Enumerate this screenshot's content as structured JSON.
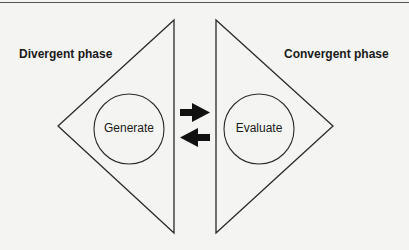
{
  "diagram": {
    "phases": [
      {
        "label": "Divergent phase",
        "node": "Generate"
      },
      {
        "label": "Convergent phase",
        "node": "Evaluate"
      }
    ],
    "arrows": [
      {
        "direction": "right",
        "meaning": "from divergent to convergent"
      },
      {
        "direction": "left",
        "meaning": "from convergent to divergent"
      }
    ],
    "colors": {
      "stroke": "#2a2a2a",
      "background": "#f4f4f2",
      "text": "#1a1a1a"
    }
  }
}
